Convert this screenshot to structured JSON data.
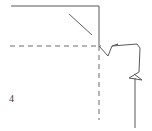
{
  "figure": {
    "kind": "technical-line-drawing",
    "width": 152,
    "height": 131,
    "background_color": "#ffffff",
    "stroke_color": "#595959",
    "dashed_stroke_color": "#6b6b6b",
    "stroke_width": 1,
    "dash_pattern": "5 4",
    "labels": [
      {
        "id": "ref-4",
        "text": "4",
        "x": 9,
        "y": 94,
        "color": "#3a3a3a",
        "font_size": 10
      }
    ],
    "elements": {
      "top_solid_horizontal": {
        "name": "top-solid-horizontal-line",
        "points": "11,6 99,6"
      },
      "right_solid_vertical": {
        "name": "corner-solid-vertical-line",
        "points": "99,6 99,46"
      },
      "leader_diagonal": {
        "name": "leader-diagonal-line",
        "points": "69,14 92,35"
      },
      "horizontal_dashed_axis": {
        "name": "horizontal-dashed-axis",
        "points": "10,46 101,46"
      },
      "vertical_dashed_axis": {
        "name": "vertical-dashed-axis",
        "points": "99,46 99,120"
      },
      "upper_break_zigzag": {
        "name": "upper-break-zigzag",
        "points": "99,46 108,56 112,46 118,44 116,45"
      },
      "upper_connector": {
        "name": "upper-connector-polyline",
        "points": "112,46 137,44 140,48 139,72"
      },
      "lower_break_zigzag": {
        "name": "lower-break-zigzag",
        "points": "139,72 129,78 142,80 134,74"
      },
      "lower_solid_vertical": {
        "name": "lower-solid-vertical-line",
        "points": "135,78 135,128"
      }
    }
  }
}
